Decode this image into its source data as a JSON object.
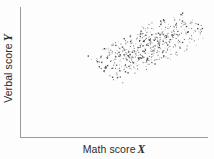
{
  "figure": {
    "background_color": "#fdfdfd",
    "axis_color": "#9a9a9a",
    "point_color": "#3a3a3a",
    "width": 214,
    "height": 159
  },
  "chart_data": {
    "type": "scatter",
    "title": "",
    "xlabel": "Math score",
    "xlabel_variable": "X",
    "ylabel": "Verbal score",
    "ylabel_variable": "Y",
    "grid": false,
    "legend": "none",
    "axis_ticks": [],
    "xlim": [
      0,
      1
    ],
    "ylim": [
      0,
      1
    ],
    "n_points": 520,
    "correlation": 0.62,
    "cloud": {
      "center_x": 0.695,
      "center_y": 0.665,
      "major_axis": 0.47,
      "minor_axis": 0.175,
      "angle_degrees": 38,
      "x_range": [
        0.22,
        0.96
      ],
      "y_range": [
        0.33,
        0.99
      ]
    },
    "note": "Positively correlated elliptical point cloud; no tick labels shown on either axis."
  }
}
